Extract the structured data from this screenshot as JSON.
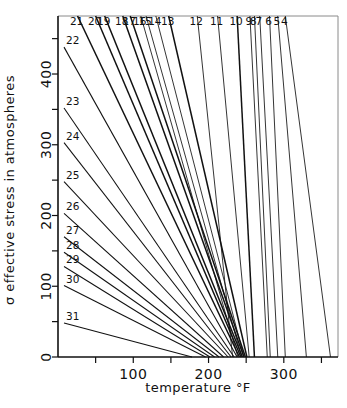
{
  "chart_data": {
    "type": "line",
    "title": "",
    "xlabel": "temperature °F",
    "ylabel": "σ effective stress in atmospheres",
    "xlim": [
      0,
      372
    ],
    "ylim": [
      0,
      482
    ],
    "grid": false,
    "legend": "none",
    "xticks": [
      0,
      50,
      100,
      150,
      200,
      250,
      300,
      350
    ],
    "xticklabels": [
      "",
      "",
      "100",
      "",
      "200",
      "",
      "300",
      ""
    ],
    "xtick_labeled": [
      {
        "value": 100,
        "label": "100"
      },
      {
        "value": 200,
        "label": "200"
      },
      {
        "value": 300,
        "label": "300"
      }
    ],
    "yticks": [
      0,
      50,
      100,
      150,
      200,
      250,
      300,
      350,
      400,
      450
    ],
    "yticklabels": [
      "0",
      "",
      "100",
      "",
      "200",
      "",
      "300",
      "",
      "400",
      ""
    ],
    "ytick_labeled": [
      {
        "value": 0,
        "label": "0"
      },
      {
        "value": 100,
        "label": "100"
      },
      {
        "value": 200,
        "label": "200"
      },
      {
        "value": 300,
        "label": "300"
      },
      {
        "value": 400,
        "label": "400"
      }
    ],
    "series_note": "Each series is a straight line labeled by its number; labels 21–21 through 4 sit on the top edge, labels 22–31 sit on the left axis.",
    "series": [
      {
        "name": "31",
        "label": "31",
        "label_side": "left",
        "weight": "normal",
        "x": [
          8,
          178
        ],
        "y": [
          48,
          0
        ]
      },
      {
        "name": "30",
        "label": "30",
        "label_side": "left",
        "weight": "normal",
        "x": [
          8,
          196
        ],
        "y": [
          101,
          0
        ]
      },
      {
        "name": "29",
        "label": "29",
        "label_side": "left",
        "weight": "normal",
        "x": [
          8,
          202
        ],
        "y": [
          128,
          0
        ]
      },
      {
        "name": "28",
        "label": "28",
        "label_side": "left",
        "weight": "normal",
        "x": [
          8,
          208
        ],
        "y": [
          148,
          0
        ]
      },
      {
        "name": "27",
        "label": "27",
        "label_side": "left",
        "weight": "normal",
        "x": [
          8,
          214
        ],
        "y": [
          170,
          0
        ]
      },
      {
        "name": "26",
        "label": "26",
        "label_side": "left",
        "weight": "normal",
        "x": [
          8,
          220
        ],
        "y": [
          203,
          0
        ]
      },
      {
        "name": "25",
        "label": "25",
        "label_side": "left",
        "weight": "normal",
        "x": [
          8,
          226
        ],
        "y": [
          248,
          0
        ]
      },
      {
        "name": "24",
        "label": "24",
        "label_side": "left",
        "weight": "normal",
        "x": [
          8,
          230
        ],
        "y": [
          303,
          0
        ]
      },
      {
        "name": "23",
        "label": "23",
        "label_side": "left",
        "weight": "normal",
        "x": [
          8,
          234
        ],
        "y": [
          352,
          0
        ]
      },
      {
        "name": "22",
        "label": "22",
        "label_side": "left",
        "weight": "normal",
        "x": [
          8,
          238
        ],
        "y": [
          438,
          0
        ]
      },
      {
        "name": "21",
        "label": "21",
        "label_side": "top",
        "weight": "heavy",
        "x": [
          26,
          241
        ],
        "y": [
          482,
          0
        ]
      },
      {
        "name": "20",
        "label": "20",
        "label_side": "top",
        "weight": "heavy",
        "x": [
          50,
          243
        ],
        "y": [
          482,
          0
        ]
      },
      {
        "name": "19",
        "label": "19",
        "label_side": "top",
        "weight": "heavy",
        "x": [
          62,
          245
        ],
        "y": [
          482,
          0
        ]
      },
      {
        "name": "18",
        "label": "18",
        "label_side": "top",
        "weight": "heavy",
        "x": [
          86,
          247
        ],
        "y": [
          482,
          0
        ]
      },
      {
        "name": "17",
        "label": "17",
        "label_side": "top",
        "weight": "heavy",
        "x": [
          96,
          249
        ],
        "y": [
          482,
          0
        ]
      },
      {
        "name": "16",
        "label": "16",
        "label_side": "top",
        "weight": "light",
        "x": [
          110,
          239
        ],
        "y": [
          482,
          0
        ]
      },
      {
        "name": "15",
        "label": "15",
        "label_side": "top",
        "weight": "light",
        "x": [
          117,
          244
        ],
        "y": [
          482,
          0
        ]
      },
      {
        "name": "14",
        "label": "14",
        "label_side": "top",
        "weight": "light",
        "x": [
          130,
          247
        ],
        "y": [
          482,
          0
        ]
      },
      {
        "name": "13",
        "label": "13",
        "label_side": "top",
        "weight": "heavy",
        "x": [
          147,
          251
        ],
        "y": [
          482,
          0
        ]
      },
      {
        "name": "12",
        "label": "12",
        "label_side": "top",
        "weight": "light",
        "x": [
          185,
          232
        ],
        "y": [
          482,
          0
        ]
      },
      {
        "name": "11",
        "label": "11",
        "label_side": "top",
        "weight": "light",
        "x": [
          212,
          254
        ],
        "y": [
          482,
          0
        ]
      },
      {
        "name": "10",
        "label": "10",
        "label_side": "top",
        "weight": "heavy",
        "x": [
          238,
          261
        ],
        "y": [
          482,
          0
        ]
      },
      {
        "name": "9",
        "label": "9",
        "label_side": "top",
        "weight": "light",
        "x": [
          255,
          278
        ],
        "y": [
          482,
          0
        ]
      },
      {
        "name": "8",
        "label": "8",
        "label_side": "top",
        "weight": "light",
        "x": [
          261,
          282
        ],
        "y": [
          482,
          0
        ]
      },
      {
        "name": "7",
        "label": "7",
        "label_side": "top",
        "weight": "light",
        "x": [
          268,
          292
        ],
        "y": [
          482,
          0
        ]
      },
      {
        "name": "6",
        "label": "6",
        "label_side": "top",
        "weight": "light",
        "x": [
          281,
          302
        ],
        "y": [
          482,
          0
        ]
      },
      {
        "name": "5",
        "label": "5",
        "label_side": "top",
        "weight": "light",
        "x": [
          292,
          330
        ],
        "y": [
          482,
          0
        ]
      },
      {
        "name": "4",
        "label": "4",
        "label_side": "top",
        "weight": "light",
        "x": [
          302,
          362
        ],
        "y": [
          482,
          0
        ]
      }
    ]
  },
  "axes": {
    "y_title": "σ effective stress in atmospheres",
    "x_title": "temperature °F",
    "y_labels": [
      "400",
      "300",
      "200",
      "100",
      "0"
    ],
    "x_labels": [
      "100",
      "200",
      "300"
    ]
  }
}
